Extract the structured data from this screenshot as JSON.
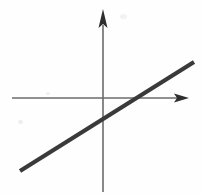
{
  "figure": {
    "kind": "line-graph",
    "title": "",
    "width": 201,
    "height": 195,
    "background_color": "#fefefe"
  },
  "colors": {
    "axis": "#6b6b6b",
    "axis_dark": "#555555",
    "line": "#3a3a3a",
    "arrowhead": "#2e2e2e",
    "background": "#fefefe",
    "artifact": "#ededed"
  },
  "axes": {
    "x_axis": {
      "label": "",
      "name": "x-axis",
      "y_position": 98,
      "x_start": 12,
      "x_end": 188,
      "stroke_width": 1.6,
      "arrow": {
        "name": "x-axis-arrowhead",
        "direction": "right",
        "tip_x": 189,
        "tip_y": 98,
        "width": 15,
        "height": 9
      }
    },
    "y_axis": {
      "label": "",
      "name": "y-axis",
      "x_position": 103,
      "y_start": 192,
      "y_end": 10,
      "stroke_width": 1.6,
      "arrow": {
        "name": "y-axis-arrowhead",
        "direction": "up",
        "tip_x": 103,
        "tip_y": 9,
        "width": 9,
        "height": 19
      }
    },
    "origin": {
      "x": 103,
      "y": 98
    },
    "tick_labels": [],
    "gridlines": false
  },
  "chart_data": {
    "type": "line",
    "title": "",
    "xlabel": "",
    "ylabel": "",
    "grid": false,
    "legend": null,
    "series": [
      {
        "name": "linear-function",
        "description": "straight line with positive slope crossing both axes",
        "color": "#3a3a3a",
        "stroke_width": 4.2,
        "points_px": [
          {
            "x": 20,
            "y": 171
          },
          {
            "x": 194,
            "y": 62
          }
        ],
        "x_intercept_px": {
          "x": 128,
          "y": 98
        },
        "y_intercept_px": {
          "x": 103,
          "y": 112
        },
        "slope_math": 0.63,
        "slope_screen": -0.63
      }
    ],
    "annotations": []
  },
  "artifacts": [
    {
      "name": "scan-speck-left",
      "x": 18,
      "y": 120,
      "w": 5,
      "h": 4
    },
    {
      "name": "scan-speck-upper",
      "x": 46,
      "y": 92,
      "w": 4,
      "h": 3
    },
    {
      "name": "scan-smudge-top",
      "x": 120,
      "y": 14,
      "w": 7,
      "h": 5
    }
  ]
}
